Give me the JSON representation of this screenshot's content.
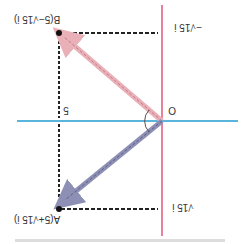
{
  "diagram": {
    "orientation": "rotated-180",
    "origin_label": "O",
    "real_tick_label": "5",
    "point_a": {
      "label": "A(5+√15 i)",
      "re": 5,
      "im": "√15"
    },
    "point_b": {
      "label": "B(5−√15 i)",
      "re": 5,
      "im": "−√15"
    },
    "imag_tick_pos_label": "√15 i",
    "imag_tick_neg_label": "−√15 i",
    "caption": "…",
    "colors": {
      "imag_axis": "#e8819b",
      "real_axis": "#5ab4dc",
      "vector_a": "#8e8fb5",
      "vector_b": "#eab0b8",
      "guide": "#222222",
      "point": "#111111"
    }
  }
}
